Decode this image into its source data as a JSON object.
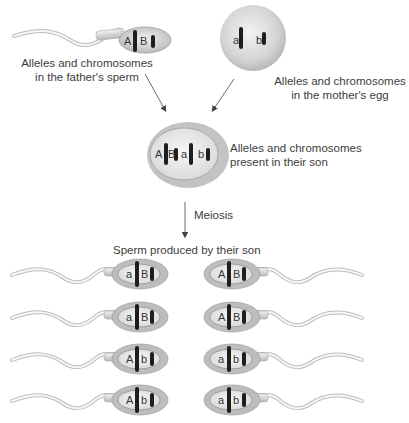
{
  "father": {
    "label_line1": "Alleles and chromosomes",
    "label_line2": "in the father's sperm",
    "alleles": [
      "A",
      "B"
    ]
  },
  "mother": {
    "label_line1": "Alleles and chromosomes",
    "label_line2": "in the mother's egg",
    "alleles": [
      "a",
      "b"
    ]
  },
  "son": {
    "label_line1": "Alleles and chromosomes",
    "label_line2": "present in their son",
    "alleles": [
      "A",
      "B",
      "a",
      "b"
    ]
  },
  "process": {
    "label": "Meiosis"
  },
  "offspring": {
    "title": "Sperm produced by their son",
    "left": [
      {
        "alleles": [
          "a",
          "B"
        ]
      },
      {
        "alleles": [
          "a",
          "B"
        ]
      },
      {
        "alleles": [
          "A",
          "b"
        ]
      },
      {
        "alleles": [
          "A",
          "b"
        ]
      }
    ],
    "right": [
      {
        "alleles": [
          "A",
          "B"
        ]
      },
      {
        "alleles": [
          "A",
          "B"
        ]
      },
      {
        "alleles": [
          "a",
          "b"
        ]
      },
      {
        "alleles": [
          "a",
          "b"
        ]
      }
    ]
  },
  "colors": {
    "cell_fill": "#c8c8c8",
    "cell_light": "#efefef",
    "chromosome": "#1e1e1e",
    "arrow": "#444444"
  }
}
